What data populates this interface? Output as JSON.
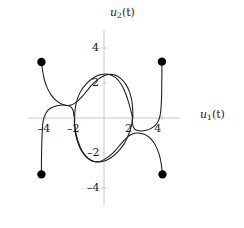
{
  "figure": {
    "kind": "phase-portrait",
    "background": "#ffffff",
    "curve_color": "#1a1a1a",
    "axis_color": "#c8c8c8",
    "marker_color": "#000000"
  },
  "axes": {
    "x_label_main": "u",
    "x_label_sub": "1",
    "x_label_arg": "(t)",
    "y_label_main": "u",
    "y_label_sub": "2",
    "y_label_arg": "(t)",
    "x_ticks": [
      {
        "value": -4,
        "label": "–4"
      },
      {
        "value": -2,
        "label": "–2"
      },
      {
        "value": 2,
        "label": "2"
      },
      {
        "value": 4,
        "label": "4"
      }
    ],
    "y_ticks": [
      {
        "value": 4,
        "label": "4"
      },
      {
        "value": 2,
        "label": "2"
      },
      {
        "value": -2,
        "label": "–2"
      },
      {
        "value": -4,
        "label": "–4"
      }
    ],
    "xlim": [
      -5.2,
      5.2
    ],
    "ylim": [
      -5.0,
      5.0
    ],
    "grid": false
  },
  "chart_data": {
    "type": "line",
    "title": "",
    "xlabel": "u_1(t)",
    "ylabel": "u_2(t)",
    "xlim": [
      -5.2,
      5.2
    ],
    "ylim": [
      -5.0,
      5.0
    ],
    "grid": false,
    "series": [
      {
        "name": "limit-cycle",
        "closed": true,
        "points": [
          [
            1.95,
            0.08
          ],
          [
            1.75,
            0.72
          ],
          [
            1.52,
            1.33
          ],
          [
            1.2,
            1.9
          ],
          [
            0.78,
            2.32
          ],
          [
            0.3,
            2.5
          ],
          [
            -0.2,
            2.48
          ],
          [
            -0.72,
            2.3
          ],
          [
            -1.22,
            1.95
          ],
          [
            -1.65,
            1.45
          ],
          [
            -1.92,
            0.82
          ],
          [
            -2.02,
            0.12
          ],
          [
            -1.98,
            -0.62
          ],
          [
            -1.8,
            -1.28
          ],
          [
            -1.52,
            -1.86
          ],
          [
            -1.12,
            -2.28
          ],
          [
            -0.62,
            -2.5
          ],
          [
            -0.1,
            -2.48
          ],
          [
            0.42,
            -2.3
          ],
          [
            0.92,
            -1.96
          ],
          [
            1.38,
            -1.48
          ],
          [
            1.72,
            -0.88
          ],
          [
            1.92,
            -0.3
          ],
          [
            1.95,
            0.08
          ]
        ]
      },
      {
        "name": "trajectory-upper-left",
        "closed": false,
        "start_point": [
          -4.3,
          3.2
        ],
        "points": [
          [
            -4.3,
            3.2
          ],
          [
            -4.22,
            2.7
          ],
          [
            -4.1,
            2.2
          ],
          [
            -3.92,
            1.75
          ],
          [
            -3.66,
            1.35
          ],
          [
            -3.32,
            1.02
          ],
          [
            -2.92,
            0.8
          ],
          [
            -2.5,
            0.72
          ],
          [
            -2.2,
            0.76
          ],
          [
            -2.0,
            0.85
          ],
          [
            -1.8,
            0.98
          ],
          [
            -1.5,
            1.22
          ],
          [
            -1.15,
            1.58
          ],
          [
            -0.8,
            1.92
          ],
          [
            -0.4,
            2.22
          ],
          [
            0.0,
            2.42
          ],
          [
            0.4,
            2.5
          ],
          [
            0.8,
            2.44
          ],
          [
            1.18,
            2.24
          ],
          [
            1.5,
            1.92
          ],
          [
            1.76,
            1.48
          ],
          [
            1.92,
            0.95
          ],
          [
            1.98,
            0.4
          ],
          [
            1.98,
            0.05
          ]
        ]
      },
      {
        "name": "trajectory-upper-right",
        "closed": false,
        "start_point": [
          3.98,
          3.22
        ],
        "points": [
          [
            3.98,
            3.22
          ],
          [
            3.98,
            2.6
          ],
          [
            3.97,
            1.95
          ],
          [
            3.96,
            1.3
          ],
          [
            3.93,
            0.7
          ],
          [
            3.88,
            0.25
          ],
          [
            3.76,
            -0.12
          ],
          [
            3.52,
            -0.42
          ],
          [
            3.18,
            -0.62
          ],
          [
            2.82,
            -0.72
          ],
          [
            2.5,
            -0.74
          ],
          [
            2.25,
            -0.7
          ],
          [
            2.1,
            -0.62
          ],
          [
            2.0,
            -0.48
          ],
          [
            1.95,
            -0.28
          ],
          [
            1.95,
            -0.08
          ]
        ]
      },
      {
        "name": "trajectory-lower-left",
        "closed": false,
        "start_point": [
          -4.3,
          -3.22
        ],
        "points": [
          [
            -4.3,
            -3.22
          ],
          [
            -4.3,
            -2.6
          ],
          [
            -4.29,
            -1.95
          ],
          [
            -4.27,
            -1.3
          ],
          [
            -4.24,
            -0.72
          ],
          [
            -4.2,
            -0.26
          ],
          [
            -4.08,
            0.12
          ],
          [
            -3.86,
            0.44
          ],
          [
            -3.52,
            0.62
          ],
          [
            -3.16,
            0.72
          ],
          [
            -2.84,
            0.74
          ],
          [
            -2.58,
            0.72
          ],
          [
            -2.38,
            0.68
          ],
          [
            -2.22,
            0.58
          ],
          [
            -2.12,
            0.42
          ],
          [
            -2.08,
            0.22
          ],
          [
            -2.06,
            0.08
          ]
        ]
      },
      {
        "name": "trajectory-lower-right",
        "closed": false,
        "start_point": [
          4.02,
          -3.22
        ],
        "points": [
          [
            4.02,
            -3.22
          ],
          [
            3.95,
            -2.72
          ],
          [
            3.84,
            -2.22
          ],
          [
            3.66,
            -1.78
          ],
          [
            3.42,
            -1.4
          ],
          [
            3.1,
            -1.1
          ],
          [
            2.72,
            -0.92
          ],
          [
            2.34,
            -0.86
          ],
          [
            2.05,
            -0.88
          ],
          [
            1.82,
            -0.96
          ],
          [
            1.52,
            -1.16
          ],
          [
            1.18,
            -1.46
          ],
          [
            0.82,
            -1.82
          ],
          [
            0.42,
            -2.14
          ],
          [
            0.0,
            -2.38
          ],
          [
            -0.42,
            -2.5
          ],
          [
            -0.82,
            -2.46
          ],
          [
            -1.18,
            -2.26
          ],
          [
            -1.5,
            -1.94
          ],
          [
            -1.76,
            -1.5
          ],
          [
            -1.94,
            -0.98
          ],
          [
            -2.02,
            -0.44
          ],
          [
            -2.04,
            -0.08
          ]
        ]
      }
    ],
    "markers": [
      {
        "name": "initial-condition-upper-left",
        "x": -4.3,
        "y": 3.2
      },
      {
        "name": "initial-condition-upper-right",
        "x": 3.98,
        "y": 3.22
      },
      {
        "name": "initial-condition-lower-left",
        "x": -4.3,
        "y": -3.22
      },
      {
        "name": "initial-condition-lower-right",
        "x": 4.02,
        "y": -3.22
      }
    ]
  }
}
